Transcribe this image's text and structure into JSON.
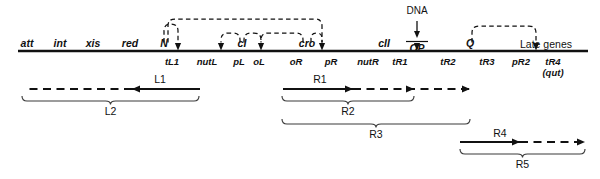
{
  "diagram": {
    "baseline": {
      "name": "chromosome-line",
      "x1": 18,
      "x2": 588,
      "y": 51
    },
    "genes_above": [
      {
        "label": "att",
        "x": 27
      },
      {
        "label": "int",
        "x": 60
      },
      {
        "label": "xis",
        "x": 93
      },
      {
        "label": "red",
        "x": 130
      },
      {
        "label": "N",
        "x": 164
      },
      {
        "label": "cI",
        "x": 242
      },
      {
        "label": "cro",
        "x": 307
      },
      {
        "label": "cII",
        "x": 384
      },
      {
        "label": "Q",
        "x": 470
      }
    ],
    "op_label": {
      "label": "OP",
      "x": 417
    },
    "dna_label": {
      "label": "DNA",
      "x": 417,
      "y": 6
    },
    "late_genes_label": {
      "label": "Late genes",
      "x": 546
    },
    "sites_below": [
      {
        "label": "tL1",
        "x": 172,
        "bold": ""
      },
      {
        "label": "nutL",
        "x": 207,
        "bold": ""
      },
      {
        "label": "pL",
        "x": 239,
        "bold": ""
      },
      {
        "label": "oL",
        "x": 259,
        "bold": "oL"
      },
      {
        "label": "oR",
        "x": 296,
        "bold": ""
      },
      {
        "label": "pR",
        "x": 331,
        "bold": ""
      },
      {
        "label": "nutR",
        "x": 368,
        "bold": ""
      },
      {
        "label": "tR1",
        "x": 400,
        "bold": ""
      },
      {
        "label": "tR2",
        "x": 448,
        "bold": ""
      },
      {
        "label": "tR3",
        "x": 487,
        "bold": ""
      },
      {
        "label": "pR2",
        "x": 521,
        "bold": ""
      },
      {
        "label": "tR4",
        "x": 553,
        "bold": ""
      }
    ],
    "qut_label": {
      "label": "(qut)",
      "x": 553
    },
    "arrowheads_on_line": [
      {
        "name": "arrowhead-nutL",
        "x": 178
      },
      {
        "name": "arrowhead-oL",
        "x": 221
      },
      {
        "name": "arrowhead-oR",
        "x": 261
      },
      {
        "name": "arrowhead-nutR",
        "x": 322
      },
      {
        "name": "arrowhead-op",
        "x": 417
      },
      {
        "name": "arrowhead-tR4",
        "x": 536
      }
    ],
    "arcs": [
      {
        "name": "arc-N-to-nutL",
        "from": 164,
        "to": 178,
        "top": 24,
        "style": "dashed"
      },
      {
        "name": "arc-N-to-nutR",
        "from": 168,
        "to": 322,
        "top": 19,
        "style": "dashed"
      },
      {
        "name": "arc-cI-to-oL",
        "from": 240,
        "to": 221,
        "top": 33,
        "style": "dashed"
      },
      {
        "name": "arc-cI-to-oR",
        "from": 244,
        "to": 261,
        "top": 33,
        "style": "dashed"
      },
      {
        "name": "arc-cro-to-oR",
        "from": 303,
        "to": 261,
        "top": 33,
        "style": "dashed"
      },
      {
        "name": "arc-cro-to-nutR",
        "from": 311,
        "to": 322,
        "top": 33,
        "style": "dashed"
      },
      {
        "name": "arc-Q-to-tR4",
        "from": 472,
        "to": 536,
        "top": 26,
        "style": "dashed"
      }
    ],
    "transcripts": [
      {
        "name": "L1",
        "label": "L1",
        "label_x": 160,
        "label_y": 74,
        "y": 89,
        "direction": "left",
        "solid": {
          "x1": 200,
          "x2": 132
        },
        "dashed": {
          "x1": 132,
          "x2": 24
        },
        "arrowhead_x": 132
      },
      {
        "name": "R1",
        "label": "R1",
        "label_x": 320,
        "label_y": 74,
        "y": 89,
        "direction": "right",
        "solid": {
          "x1": 283,
          "x2": 353
        },
        "dashed": {
          "x1": 353,
          "x2": 470
        },
        "arrowhead_x": 353
      },
      {
        "name": "R1b",
        "label": "",
        "label_x": 0,
        "label_y": 0,
        "y": 89,
        "direction": "right",
        "solid": {
          "x1": 0,
          "x2": 0
        },
        "dashed": {
          "x1": 0,
          "x2": 0
        },
        "arrowhead_x": 414
      },
      {
        "name": "R1c",
        "label": "",
        "label_x": 0,
        "label_y": 0,
        "y": 89,
        "direction": "right",
        "solid": {
          "x1": 0,
          "x2": 0
        },
        "dashed": {
          "x1": 0,
          "x2": 0
        },
        "arrowhead_x": 470
      },
      {
        "name": "R4",
        "label": "R4",
        "label_x": 500,
        "label_y": 128,
        "y": 142,
        "direction": "right",
        "solid": {
          "x1": 460,
          "x2": 520
        },
        "dashed": {
          "x1": 520,
          "x2": 585
        },
        "arrowhead_x": 520
      },
      {
        "name": "R4b",
        "label": "",
        "label_x": 0,
        "label_y": 0,
        "y": 142,
        "direction": "right",
        "solid": {
          "x1": 0,
          "x2": 0
        },
        "dashed": {
          "x1": 0,
          "x2": 0
        },
        "arrowhead_x": 585
      }
    ],
    "braces": [
      {
        "name": "brace-L2",
        "label": "L2",
        "x1": 22,
        "x2": 199,
        "y": 96,
        "label_y": 106
      },
      {
        "name": "brace-R2",
        "label": "R2",
        "x1": 282,
        "x2": 414,
        "y": 96,
        "label_y": 106
      },
      {
        "name": "brace-R3",
        "label": "R3",
        "x1": 282,
        "x2": 470,
        "y": 119,
        "label_y": 129
      },
      {
        "name": "brace-R5",
        "label": "R5",
        "x1": 460,
        "x2": 585,
        "y": 149,
        "label_y": 159
      }
    ]
  },
  "colors": {
    "ink": "#111111",
    "background": "#ffffff"
  }
}
